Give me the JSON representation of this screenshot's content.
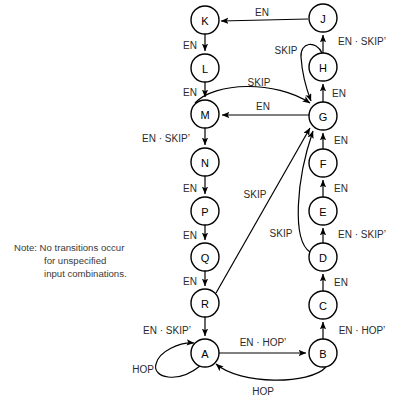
{
  "figure": {
    "type": "state-transition-diagram",
    "note": {
      "line1": "Note: No transitions occur",
      "line2": "for unspecified",
      "line3": "input combinations."
    }
  },
  "nodes": [
    {
      "id": "K",
      "label": "K",
      "cx": 205,
      "cy": 20,
      "r": 14
    },
    {
      "id": "J",
      "label": "J",
      "cx": 323,
      "cy": 18,
      "r": 14
    },
    {
      "id": "H",
      "label": "H",
      "cx": 323,
      "cy": 67,
      "r": 14
    },
    {
      "id": "L",
      "label": "L",
      "cx": 205,
      "cy": 68,
      "r": 14
    },
    {
      "id": "M",
      "label": "M",
      "cx": 205,
      "cy": 114,
      "r": 14
    },
    {
      "id": "G",
      "label": "G",
      "cx": 323,
      "cy": 116,
      "r": 14
    },
    {
      "id": "N",
      "label": "N",
      "cx": 205,
      "cy": 162,
      "r": 14
    },
    {
      "id": "F",
      "label": "F",
      "cx": 323,
      "cy": 163,
      "r": 14
    },
    {
      "id": "P",
      "label": "P",
      "cx": 205,
      "cy": 211,
      "r": 14
    },
    {
      "id": "E",
      "label": "E",
      "cx": 323,
      "cy": 211,
      "r": 14
    },
    {
      "id": "Q",
      "label": "Q",
      "cx": 205,
      "cy": 257,
      "r": 14
    },
    {
      "id": "D",
      "label": "D",
      "cx": 323,
      "cy": 257,
      "r": 14
    },
    {
      "id": "R",
      "label": "R",
      "cx": 205,
      "cy": 303,
      "r": 14
    },
    {
      "id": "C",
      "label": "C",
      "cx": 323,
      "cy": 305,
      "r": 14
    },
    {
      "id": "A",
      "label": "A",
      "cx": 205,
      "cy": 353,
      "r": 14
    },
    {
      "id": "B",
      "label": "B",
      "cx": 323,
      "cy": 353,
      "r": 14
    }
  ],
  "edges": [
    {
      "id": "J-K",
      "from": "J",
      "to": "K",
      "label": "EN",
      "lx": 262,
      "ly": 12
    },
    {
      "id": "K-L",
      "from": "K",
      "to": "L",
      "label": "EN",
      "lx": 190,
      "ly": 45
    },
    {
      "id": "L-M",
      "from": "L",
      "to": "M",
      "label": "EN",
      "lx": 190,
      "ly": 92
    },
    {
      "id": "H-J",
      "from": "H",
      "to": "J",
      "label": "EN · SKIP’",
      "lx": 362,
      "ly": 41
    },
    {
      "id": "H-G",
      "from": "H",
      "to": "G",
      "label": "SKIP",
      "lx": 286,
      "ly": 50
    },
    {
      "id": "G-H",
      "from": "G",
      "to": "H",
      "label": "EN",
      "lx": 339,
      "ly": 93
    },
    {
      "id": "M-G",
      "from": "M",
      "to": "G",
      "label": "SKIP",
      "lx": 259,
      "ly": 82
    },
    {
      "id": "G-M",
      "from": "G",
      "to": "M",
      "label": "EN",
      "lx": 263,
      "ly": 106
    },
    {
      "id": "M-N",
      "from": "M",
      "to": "N",
      "label": "EN · SKIP’",
      "lx": 166,
      "ly": 138
    },
    {
      "id": "N-P",
      "from": "N",
      "to": "P",
      "label": "EN",
      "lx": 190,
      "ly": 188
    },
    {
      "id": "P-Q",
      "from": "P",
      "to": "Q",
      "label": "EN",
      "lx": 190,
      "ly": 235
    },
    {
      "id": "Q-R",
      "from": "Q",
      "to": "R",
      "label": "EN",
      "lx": 190,
      "ly": 281
    },
    {
      "id": "F-G",
      "from": "F",
      "to": "G",
      "label": "EN",
      "lx": 341,
      "ly": 140
    },
    {
      "id": "E-F",
      "from": "E",
      "to": "F",
      "label": "EN",
      "lx": 341,
      "ly": 188
    },
    {
      "id": "D-E",
      "from": "D",
      "to": "E",
      "label": "EN · SKIP’",
      "lx": 362,
      "ly": 234
    },
    {
      "id": "C-D",
      "from": "C",
      "to": "D",
      "label": "EN",
      "lx": 341,
      "ly": 282
    },
    {
      "id": "B-C",
      "from": "B",
      "to": "C",
      "label": "EN · HOP’",
      "lx": 362,
      "ly": 330
    },
    {
      "id": "R-G",
      "from": "R",
      "to": "G",
      "label": "SKIP",
      "lx": 255,
      "ly": 194
    },
    {
      "id": "D-G",
      "from": "D",
      "to": "G",
      "label": "SKIP",
      "lx": 281,
      "ly": 233
    },
    {
      "id": "R-A",
      "from": "R",
      "to": "A",
      "label": "EN · SKIP’",
      "lx": 167,
      "ly": 330
    },
    {
      "id": "A-B",
      "from": "A",
      "to": "B",
      "label": "EN · HOP’",
      "lx": 263,
      "ly": 342
    },
    {
      "id": "B-A",
      "from": "B",
      "to": "A",
      "label": "HOP",
      "lx": 263,
      "ly": 391
    },
    {
      "id": "A-A",
      "from": "A",
      "to": "A",
      "label": "HOP",
      "lx": 143,
      "ly": 369
    }
  ]
}
